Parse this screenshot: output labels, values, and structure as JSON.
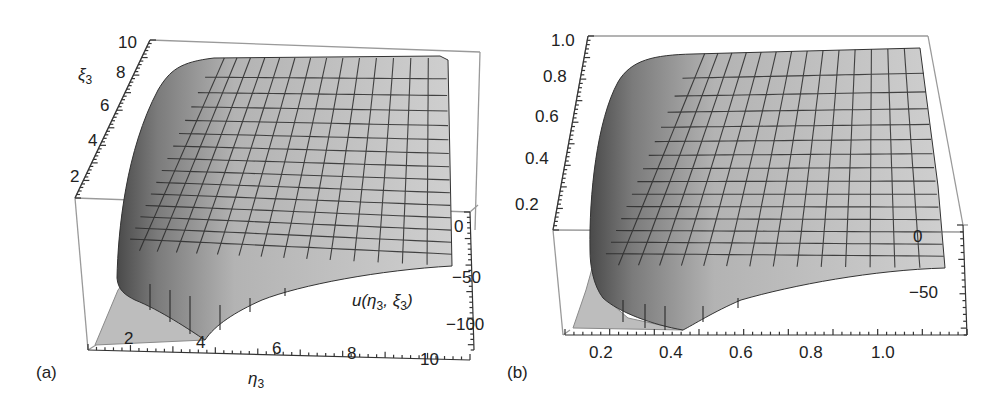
{
  "figure": {
    "panels": [
      {
        "tag": "(a)"
      },
      {
        "tag": "(b)"
      }
    ]
  },
  "chart_data": [
    {
      "type": "surface3d",
      "panel": "(a)",
      "title": "",
      "xlabel": "η3",
      "ylabel": "ξ3",
      "zlabel": "u(η3, ξ3)",
      "x_ticks": [
        "2",
        "4",
        "6",
        "8",
        "10"
      ],
      "y_ticks": [
        "2",
        "4",
        "6",
        "8",
        "10"
      ],
      "z_ticks": [
        "0",
        "-50",
        "-100"
      ],
      "xlim": [
        1,
        10
      ],
      "ylim": [
        1,
        10
      ],
      "zlim": [
        -120,
        10
      ],
      "mesh": "15x15",
      "surface_color": "#c8c8c8",
      "description": "Surface is near 0 for most of the domain and drops sharply toward about -100 near small η3 and small ξ3; clipped region (floor) visible near η3<4, ξ3 small."
    },
    {
      "type": "surface3d",
      "panel": "(b)",
      "title": "",
      "xlabel": "",
      "ylabel": "",
      "zlabel": "",
      "x_ticks": [
        "0.2",
        "0.4",
        "0.6",
        "0.8",
        "1.0"
      ],
      "y_ticks": [
        "0.2",
        "0.4",
        "0.6",
        "0.8",
        "1.0"
      ],
      "z_ticks": [
        "0",
        "-50"
      ],
      "xlim": [
        0.1,
        1.0
      ],
      "ylim": [
        0.1,
        1.0
      ],
      "zlim": [
        -80,
        10
      ],
      "mesh": "15x15",
      "surface_color": "#c8c8c8",
      "description": "Surface is near 0 for most of the domain and drops steeply toward small x and small y; clipped floor visible near x<0.45."
    }
  ],
  "labels": {
    "a": {
      "y_ticks": [
        {
          "text": "10",
          "x": 118,
          "y": 34
        },
        {
          "text": "8",
          "x": 116,
          "y": 64
        },
        {
          "text": "6",
          "x": 100,
          "y": 97
        },
        {
          "text": "4",
          "x": 88,
          "y": 132
        },
        {
          "text": "2",
          "x": 70,
          "y": 168
        }
      ],
      "x_ticks": [
        {
          "text": "2",
          "x": 124,
          "y": 330
        },
        {
          "text": "4",
          "x": 196,
          "y": 334
        },
        {
          "text": "6",
          "x": 272,
          "y": 340
        },
        {
          "text": "8",
          "x": 347,
          "y": 345
        },
        {
          "text": "10",
          "x": 420,
          "y": 351
        }
      ],
      "z_ticks": [
        {
          "text": "0",
          "x": 454,
          "y": 218
        },
        {
          "text": "−50",
          "x": 452,
          "y": 269
        },
        {
          "text": "−100",
          "x": 446,
          "y": 316
        }
      ],
      "ylabel": {
        "text": "ξ",
        "sub": "3",
        "x": 78,
        "y": 66
      },
      "xlabel": {
        "text": "η",
        "sub": "3",
        "x": 248,
        "y": 370
      },
      "zlabel": {
        "text": "u(η",
        "sub": "3",
        "rest": ", ξ",
        "sub2": "3",
        "tail": ")",
        "x": 352,
        "y": 292
      },
      "tag": {
        "x": 36,
        "y": 364
      }
    },
    "b": {
      "y_ticks": [
        {
          "text": "1.0",
          "x": 58,
          "y": 32
        },
        {
          "text": "0.8",
          "x": 50,
          "y": 68
        },
        {
          "text": "0.6",
          "x": 42,
          "y": 108
        },
        {
          "text": "0.4",
          "x": 32,
          "y": 150
        },
        {
          "text": "0.2",
          "x": 22,
          "y": 196
        }
      ],
      "x_ticks": [
        {
          "text": "0.2",
          "x": 96,
          "y": 344
        },
        {
          "text": "0.4",
          "x": 166,
          "y": 344
        },
        {
          "text": "0.6",
          "x": 236,
          "y": 344
        },
        {
          "text": "0.8",
          "x": 306,
          "y": 344
        },
        {
          "text": "1.0",
          "x": 378,
          "y": 344
        }
      ],
      "z_ticks": [
        {
          "text": "0",
          "x": 420,
          "y": 228
        },
        {
          "text": "−50",
          "x": 416,
          "y": 284
        }
      ],
      "tag": {
        "x": 14,
        "y": 364
      }
    }
  }
}
